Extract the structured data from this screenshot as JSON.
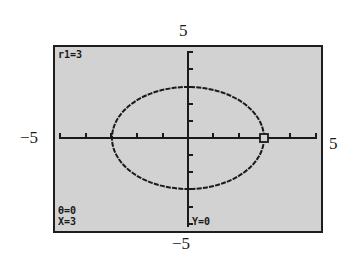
{
  "window_labels": {
    "ymax": "5",
    "ymin": "−5",
    "xmin": "−5",
    "xmax": "5"
  },
  "screen": {
    "mode": "polar",
    "equation_label": "r1=3",
    "trace": {
      "theta": "θ=0",
      "x": "X=3",
      "y": "Y=0"
    },
    "window": {
      "xmin": -5,
      "xmax": 5,
      "ymin": -5,
      "ymax": 5,
      "xscl": 1,
      "yscl": 1
    },
    "graph": {
      "type": "polar",
      "r": 3,
      "cursor_theta": 0
    },
    "colors": {
      "lcd_background": "#d2d2d2",
      "ink": "#1a1a1a",
      "frame": "#1e1e1e"
    }
  }
}
